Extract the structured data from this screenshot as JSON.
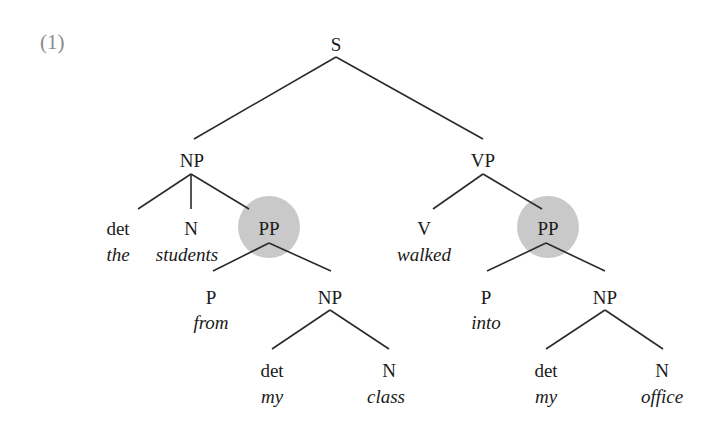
{
  "example_number": "(1)",
  "highlight_color": "#c9c9c9",
  "line_color": "#2a2a2a",
  "tree": {
    "root": "S",
    "subject_np": {
      "label": "NP",
      "det": {
        "label": "det",
        "word": "the"
      },
      "n": {
        "label": "N",
        "word": "students"
      },
      "pp": {
        "label": "PP",
        "highlighted": true,
        "p": {
          "label": "P",
          "word": "from"
        },
        "np": {
          "label": "NP",
          "det": {
            "label": "det",
            "word": "my"
          },
          "n": {
            "label": "N",
            "word": "class"
          }
        }
      }
    },
    "vp": {
      "label": "VP",
      "v": {
        "label": "V",
        "word": "walked"
      },
      "pp": {
        "label": "PP",
        "highlighted": true,
        "p": {
          "label": "P",
          "word": "into"
        },
        "np": {
          "label": "NP",
          "det": {
            "label": "det",
            "word": "my"
          },
          "n": {
            "label": "N",
            "word": "office"
          }
        }
      }
    }
  },
  "sentence": "the students from my class walked into my office"
}
